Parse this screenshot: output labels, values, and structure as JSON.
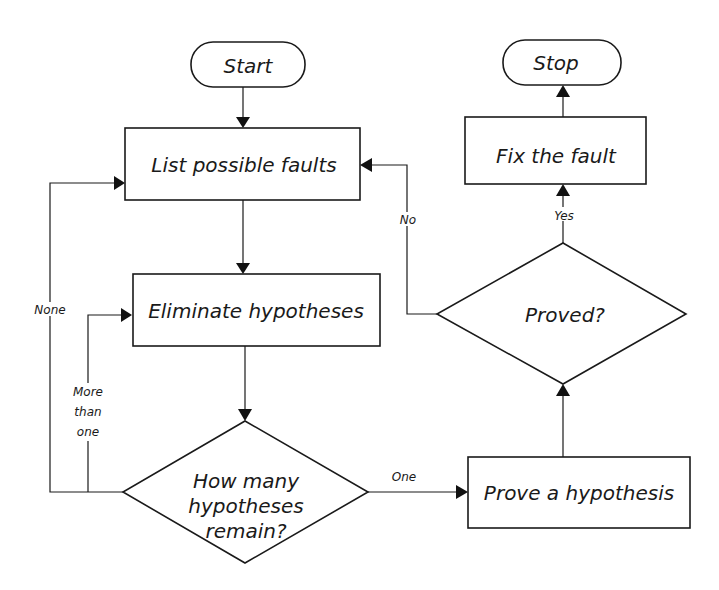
{
  "diagram": {
    "type": "flowchart",
    "nodes": {
      "start": "Start",
      "list_faults": "List possible faults",
      "eliminate": "Eliminate hypotheses",
      "how_many_line1": "How many",
      "how_many_line2": "hypotheses",
      "how_many_line3": "remain?",
      "prove": "Prove a hypothesis",
      "proved": "Proved?",
      "fix": "Fix the fault",
      "stop": "Stop"
    },
    "edge_labels": {
      "none": "None",
      "more_than_one_line1": "More",
      "more_than_one_line2": "than",
      "more_than_one_line3": "one",
      "one": "One",
      "no": "No",
      "yes": "Yes"
    },
    "edges": [
      {
        "from": "Start",
        "to": "List possible faults",
        "label": ""
      },
      {
        "from": "List possible faults",
        "to": "Eliminate hypotheses",
        "label": ""
      },
      {
        "from": "Eliminate hypotheses",
        "to": "How many hypotheses remain?",
        "label": ""
      },
      {
        "from": "How many hypotheses remain?",
        "to": "List possible faults",
        "label": "None"
      },
      {
        "from": "How many hypotheses remain?",
        "to": "Eliminate hypotheses",
        "label": "More than one"
      },
      {
        "from": "How many hypotheses remain?",
        "to": "Prove a hypothesis",
        "label": "One"
      },
      {
        "from": "Prove a hypothesis",
        "to": "Proved?",
        "label": ""
      },
      {
        "from": "Proved?",
        "to": "List possible faults",
        "label": "No"
      },
      {
        "from": "Proved?",
        "to": "Fix the fault",
        "label": "Yes"
      },
      {
        "from": "Fix the fault",
        "to": "Stop",
        "label": ""
      }
    ]
  }
}
